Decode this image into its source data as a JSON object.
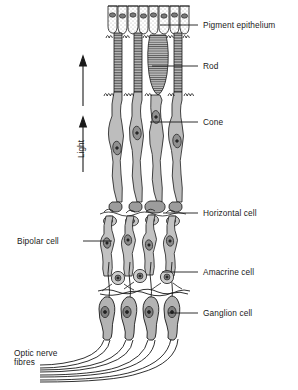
{
  "figure": {
    "colors": {
      "ink": "#1a1a1a",
      "cell_fill": "#b9b9b9",
      "cell_fill_light": "#d5d5d5",
      "nucleus": "#6e6e6e",
      "nucleus_dark": "#3c3c3c",
      "background": "#ffffff"
    }
  },
  "labels_right": [
    {
      "id": "pigment-epithelium",
      "text": "Pigment epithelium",
      "x": 203,
      "y": 21,
      "leader_x1": 193,
      "leader_x2": 160,
      "leader_y": 25
    },
    {
      "id": "rod",
      "text": "Rod",
      "x": 203,
      "y": 62,
      "leader_x1": 193,
      "leader_x2": 152,
      "leader_y": 66
    },
    {
      "id": "cone",
      "text": "Cone",
      "x": 203,
      "y": 118,
      "leader_x1": 193,
      "leader_x2": 150,
      "leader_y": 122
    },
    {
      "id": "horizontal-cell",
      "text": "Horizontal cell",
      "x": 203,
      "y": 209,
      "leader_x1": 193,
      "leader_x2": 163,
      "leader_y": 213
    },
    {
      "id": "amacrine-cell",
      "text": "Amacrine cell",
      "x": 203,
      "y": 268,
      "leader_x1": 193,
      "leader_x2": 162,
      "leader_y": 272
    },
    {
      "id": "ganglion-cell",
      "text": "Ganglion cell",
      "x": 203,
      "y": 309,
      "leader_x1": 193,
      "leader_x2": 168,
      "leader_y": 313
    }
  ],
  "labels_left": [
    {
      "id": "bipolar-cell",
      "text": "Bipolar cell",
      "x": 17,
      "y": 236,
      "leader_x1": 83,
      "leader_x2": 112,
      "leader_y": 241
    },
    {
      "id": "optic-nerve-line1",
      "text": "Optic nerve",
      "x": 14,
      "y": 352
    },
    {
      "id": "optic-nerve-line2",
      "text": "fibres",
      "x": 14,
      "y": 361
    }
  ],
  "light_axis": {
    "label": "Light",
    "label_x": 78,
    "label_y": 152,
    "arrows": [
      {
        "id": "light-arrow-upper",
        "x": 83,
        "y_tail": 106,
        "y_head": 58
      },
      {
        "id": "light-arrow-lower",
        "x": 83,
        "y_tail": 172,
        "y_head": 117
      }
    ]
  },
  "layers": [
    {
      "id": "pigment-epithelium-layer",
      "name": "Pigment epithelium",
      "y_top": 5,
      "y_bottom": 33
    },
    {
      "id": "photoreceptor-outer-segments",
      "name": "Rod and cone outer segments",
      "y_top": 33,
      "y_bottom": 108
    },
    {
      "id": "photoreceptor-cell-bodies",
      "name": "Rod and cone cell bodies",
      "y_top": 108,
      "y_bottom": 200
    },
    {
      "id": "outer-plexiform-horizontal",
      "name": "Horizontal cell layer",
      "y_top": 200,
      "y_bottom": 222
    },
    {
      "id": "bipolar-cell-layer",
      "name": "Bipolar cell layer",
      "y_top": 222,
      "y_bottom": 265
    },
    {
      "id": "amacrine-cell-layer",
      "name": "Amacrine cell layer",
      "y_top": 265,
      "y_bottom": 292
    },
    {
      "id": "ganglion-cell-layer",
      "name": "Ganglion cell layer",
      "y_top": 292,
      "y_bottom": 340
    },
    {
      "id": "optic-nerve-fibre-layer",
      "name": "Optic nerve fibres",
      "y_top": 340,
      "y_bottom": 380
    }
  ],
  "columns": {
    "count": 4,
    "x_centers": [
      118,
      138,
      158,
      178
    ],
    "cone_index": 2
  }
}
